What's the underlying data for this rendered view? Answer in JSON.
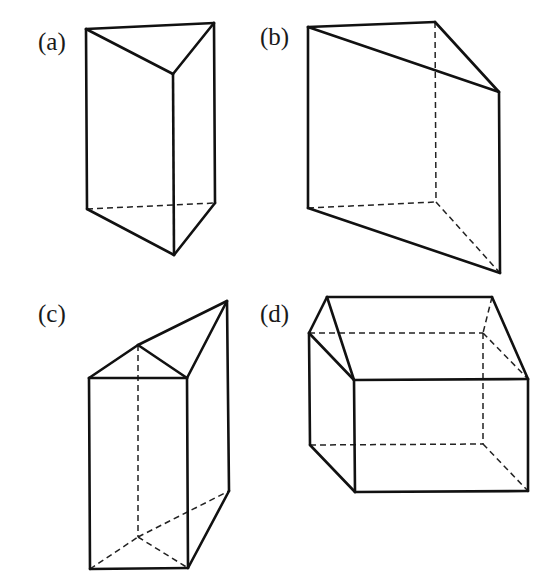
{
  "figures": [
    {
      "id": "a",
      "label": "(a)",
      "label_pos": [
        38,
        50
      ],
      "description": "Triangular prism, vertical, front edge toward viewer",
      "solid_edges": [
        [
          [
            86,
            29
          ],
          [
            214,
            23
          ]
        ],
        [
          [
            86,
            29
          ],
          [
            173,
            74
          ]
        ],
        [
          [
            214,
            23
          ],
          [
            173,
            74
          ]
        ],
        [
          [
            86,
            29
          ],
          [
            87,
            209
          ]
        ],
        [
          [
            214,
            23
          ],
          [
            215,
            203
          ]
        ],
        [
          [
            173,
            74
          ],
          [
            174,
            255
          ]
        ],
        [
          [
            87,
            209
          ],
          [
            174,
            255
          ]
        ],
        [
          [
            174,
            255
          ],
          [
            215,
            203
          ]
        ]
      ],
      "dashed_edges": [
        [
          [
            87,
            209
          ],
          [
            215,
            203
          ]
        ]
      ]
    },
    {
      "id": "b",
      "label": "(b)",
      "label_pos": [
        260,
        45
      ],
      "description": "Triangular prism, wide, with hidden back vertical edge",
      "solid_edges": [
        [
          [
            308,
            27
          ],
          [
            435,
            22
          ]
        ],
        [
          [
            308,
            27
          ],
          [
            499,
            92
          ]
        ],
        [
          [
            435,
            22
          ],
          [
            499,
            92
          ]
        ],
        [
          [
            308,
            27
          ],
          [
            308,
            208
          ]
        ],
        [
          [
            499,
            92
          ],
          [
            500,
            273
          ]
        ],
        [
          [
            308,
            208
          ],
          [
            500,
            273
          ]
        ]
      ],
      "dashed_edges": [
        [
          [
            435,
            22
          ],
          [
            436,
            202
          ]
        ],
        [
          [
            308,
            208
          ],
          [
            436,
            202
          ]
        ],
        [
          [
            436,
            202
          ],
          [
            500,
            273
          ]
        ]
      ]
    },
    {
      "id": "c",
      "label": "(c)",
      "label_pos": [
        38,
        322
      ],
      "description": "Combined prism: rectangular front face with triangular top and extended rear vertex",
      "solid_edges": [
        [
          [
            89,
            378
          ],
          [
            187,
            378
          ]
        ],
        [
          [
            89,
            378
          ],
          [
            138,
            345
          ]
        ],
        [
          [
            138,
            345
          ],
          [
            187,
            378
          ]
        ],
        [
          [
            138,
            345
          ],
          [
            227,
            301
          ]
        ],
        [
          [
            187,
            378
          ],
          [
            227,
            301
          ]
        ],
        [
          [
            89,
            378
          ],
          [
            90,
            569
          ]
        ],
        [
          [
            187,
            378
          ],
          [
            188,
            568
          ]
        ],
        [
          [
            227,
            301
          ],
          [
            229,
            491
          ]
        ],
        [
          [
            90,
            569
          ],
          [
            188,
            568
          ]
        ],
        [
          [
            188,
            568
          ],
          [
            229,
            491
          ]
        ]
      ],
      "dashed_edges": [
        [
          [
            138,
            345
          ],
          [
            138,
            537
          ]
        ],
        [
          [
            90,
            569
          ],
          [
            138,
            537
          ]
        ],
        [
          [
            138,
            537
          ],
          [
            188,
            568
          ]
        ],
        [
          [
            138,
            537
          ],
          [
            229,
            491
          ]
        ]
      ]
    },
    {
      "id": "d",
      "label": "(d)",
      "label_pos": [
        260,
        322
      ],
      "description": "Triangular prism lying on its side (house-like shape)",
      "solid_edges": [
        [
          [
            327,
            297
          ],
          [
            492,
            297
          ]
        ],
        [
          [
            327,
            297
          ],
          [
            309,
            333
          ]
        ],
        [
          [
            327,
            297
          ],
          [
            354,
            380
          ]
        ],
        [
          [
            309,
            333
          ],
          [
            354,
            380
          ]
        ],
        [
          [
            492,
            297
          ],
          [
            528,
            379
          ]
        ],
        [
          [
            354,
            380
          ],
          [
            528,
            379
          ]
        ],
        [
          [
            309,
            333
          ],
          [
            310,
            445
          ]
        ],
        [
          [
            354,
            380
          ],
          [
            355,
            492
          ]
        ],
        [
          [
            528,
            379
          ],
          [
            528,
            491
          ]
        ],
        [
          [
            310,
            445
          ],
          [
            355,
            492
          ]
        ],
        [
          [
            355,
            492
          ],
          [
            528,
            491
          ]
        ]
      ],
      "dashed_edges": [
        [
          [
            309,
            333
          ],
          [
            483,
            333
          ]
        ],
        [
          [
            492,
            297
          ],
          [
            483,
            333
          ]
        ],
        [
          [
            483,
            333
          ],
          [
            528,
            379
          ]
        ],
        [
          [
            483,
            333
          ],
          [
            483,
            444
          ]
        ],
        [
          [
            310,
            445
          ],
          [
            483,
            444
          ]
        ],
        [
          [
            483,
            444
          ],
          [
            528,
            491
          ]
        ]
      ]
    }
  ]
}
